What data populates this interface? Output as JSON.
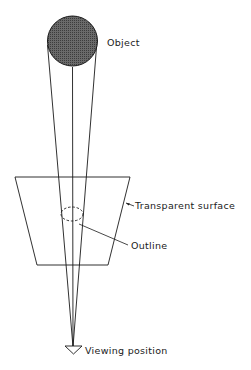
{
  "diagram": {
    "labels": {
      "object": "Object",
      "surface": "Transparent surface",
      "outline": "Outline",
      "viewer": "Viewing position"
    },
    "colors": {
      "ink": "#1a1a1a",
      "object_fill": "#5a5a5a",
      "background": "#ffffff"
    },
    "elements": [
      {
        "id": "object",
        "shape": "filled-circle"
      },
      {
        "id": "transparent-surface",
        "shape": "trapezoid"
      },
      {
        "id": "outline",
        "shape": "dashed-ellipse"
      },
      {
        "id": "viewing-position",
        "shape": "triangle"
      },
      {
        "id": "sight-lines",
        "shape": "lines",
        "count": 3
      }
    ]
  }
}
